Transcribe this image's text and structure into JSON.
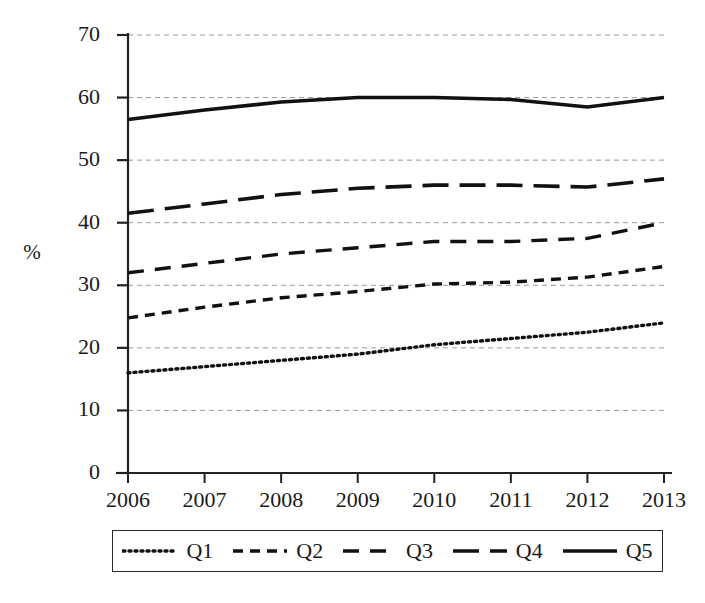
{
  "chart_data": {
    "type": "line",
    "title": "",
    "subtitle": "",
    "xlabel": "",
    "ylabel": "%",
    "categories": [
      "2006",
      "2007",
      "2008",
      "2009",
      "2010",
      "2011",
      "2012",
      "2013"
    ],
    "x": [
      2006,
      2007,
      2008,
      2009,
      2010,
      2011,
      2012,
      2013
    ],
    "ylim": [
      0,
      70
    ],
    "xlim": [
      2006,
      2013
    ],
    "yticks": [
      0,
      10,
      20,
      30,
      40,
      50,
      60,
      70
    ],
    "ytick_labels": [
      "0",
      "10",
      "20",
      "30",
      "40",
      "50",
      "60",
      "70"
    ],
    "xtick_labels": [
      "2006",
      "2007",
      "2008",
      "2009",
      "2010",
      "2011",
      "2012",
      "2013"
    ],
    "grid": true,
    "grid_axis": "y",
    "grid_style": "dashed",
    "legend_position": "bottom",
    "series": [
      {
        "name": "Q1",
        "style": "dotted",
        "color": "#111111",
        "values": [
          16.0,
          17.0,
          18.0,
          19.0,
          20.5,
          21.5,
          22.5,
          24.0
        ]
      },
      {
        "name": "Q2",
        "style": "short-dash",
        "color": "#111111",
        "values": [
          24.8,
          26.5,
          28.0,
          29.0,
          30.2,
          30.5,
          31.3,
          33.0
        ]
      },
      {
        "name": "Q3",
        "style": "medium-dash",
        "color": "#111111",
        "values": [
          32.0,
          33.5,
          35.0,
          36.0,
          37.0,
          37.0,
          37.5,
          40.0
        ]
      },
      {
        "name": "Q4",
        "style": "long-dash",
        "color": "#111111",
        "values": [
          41.5,
          43.0,
          44.5,
          45.5,
          46.0,
          46.0,
          45.7,
          47.0
        ]
      },
      {
        "name": "Q5",
        "style": "solid",
        "color": "#111111",
        "values": [
          56.5,
          58.0,
          59.3,
          60.0,
          60.0,
          59.7,
          58.5,
          60.0
        ]
      }
    ]
  },
  "legend": {
    "items": [
      {
        "label": "Q1",
        "style": "dotted"
      },
      {
        "label": "Q2",
        "style": "short-dash"
      },
      {
        "label": "Q3",
        "style": "medium-dash"
      },
      {
        "label": "Q4",
        "style": "long-dash"
      },
      {
        "label": "Q5",
        "style": "solid"
      }
    ]
  },
  "axes": {
    "y_axis_title": "%",
    "y_tick_labels": [
      "70",
      "60",
      "50",
      "40",
      "30",
      "20",
      "10",
      "0"
    ],
    "x_tick_labels": [
      "2006",
      "2007",
      "2008",
      "2009",
      "2010",
      "2011",
      "2012",
      "2013"
    ]
  }
}
